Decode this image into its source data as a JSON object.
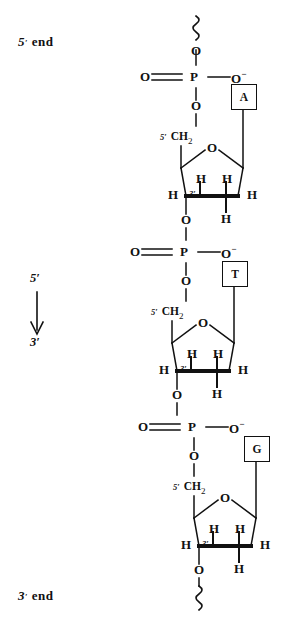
{
  "diagram": {
    "type": "chemical-structure",
    "ends": {
      "top_label_prime": "5",
      "top_label_word": "end",
      "bottom_label_prime": "3",
      "bottom_label_word": "end"
    },
    "direction": {
      "from": "5′",
      "to": "3′",
      "arrow": "down-arrow"
    },
    "atoms": {
      "oxygen": "O",
      "phosphorus": "P",
      "hydrogen": "H",
      "oxygen_anion": "O",
      "charge_minus": "−",
      "methylene": "CH",
      "methylene_sub": "2",
      "prime_five": "5′",
      "prime_three": "3′"
    },
    "nucleotides": [
      {
        "base": "A",
        "base_name": "adenine",
        "carbon5_label": "5′",
        "carbon3_label": "3′"
      },
      {
        "base": "T",
        "base_name": "thymine",
        "carbon5_label": "5′",
        "carbon3_label": "3′"
      },
      {
        "base": "G",
        "base_name": "guanine",
        "carbon5_label": "5′",
        "carbon3_label": "3′"
      }
    ],
    "colors": {
      "ink": "#111111",
      "background": "#ffffff"
    }
  }
}
